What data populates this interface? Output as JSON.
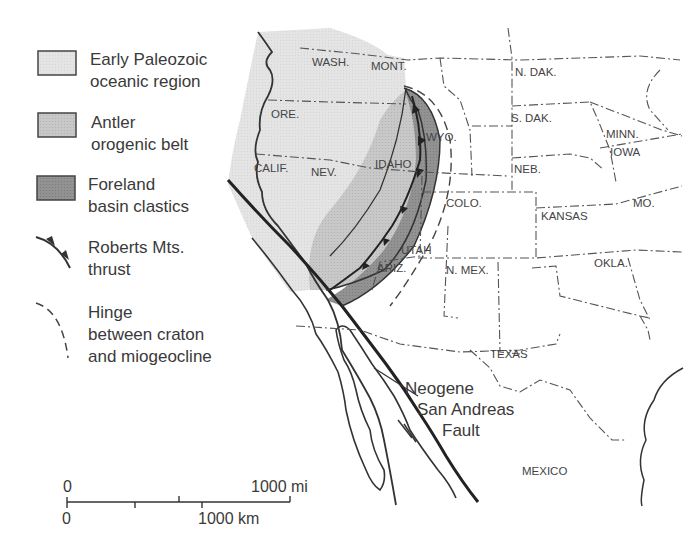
{
  "legend": {
    "items": [
      {
        "key": "early-paleozoic",
        "line1": "Early Paleozoic",
        "line2": "oceanic region",
        "fill": "#e3e3e3"
      },
      {
        "key": "antler",
        "line1": "Antler",
        "line2": "orogenic belt",
        "fill": "#c6c6c6"
      },
      {
        "key": "foreland",
        "line1": "Foreland",
        "line2": "basin clastics",
        "fill": "#8f8f8f"
      },
      {
        "key": "roberts-thrust",
        "line1": "Roberts Mts.",
        "line2": "thrust",
        "symbol": "thrust-line"
      },
      {
        "key": "hinge",
        "line1": "Hinge",
        "line2": "between craton",
        "line3": "and miogeocline",
        "symbol": "dashed-line"
      }
    ]
  },
  "states": {
    "wash": "WASH.",
    "mont": "MONT.",
    "ndak": "N. DAK.",
    "ore": "ORE.",
    "sdak": "S. DAK.",
    "wyo": "WYO.",
    "minn": "MINN.",
    "iowa": "IOWA",
    "calif": "CALIF.",
    "nev": "NEV.",
    "idaho": "IDAHO",
    "neb": "NEB.",
    "colo": "COLO.",
    "kansas": "KANSAS",
    "mo": "MO.",
    "utah": "UTAH",
    "ariz": "ARIZ.",
    "nmex": "N. MEX.",
    "okla": "OKLA.",
    "texas": "TEXAS",
    "mexico": "MEXICO"
  },
  "fault_label": {
    "line1": "Neogene",
    "line2": "San Andreas",
    "line3": "Fault"
  },
  "scale": {
    "mi_zero": "0",
    "mi_label": "1000 mi",
    "km_zero": "0",
    "km_label": "1000 km"
  }
}
